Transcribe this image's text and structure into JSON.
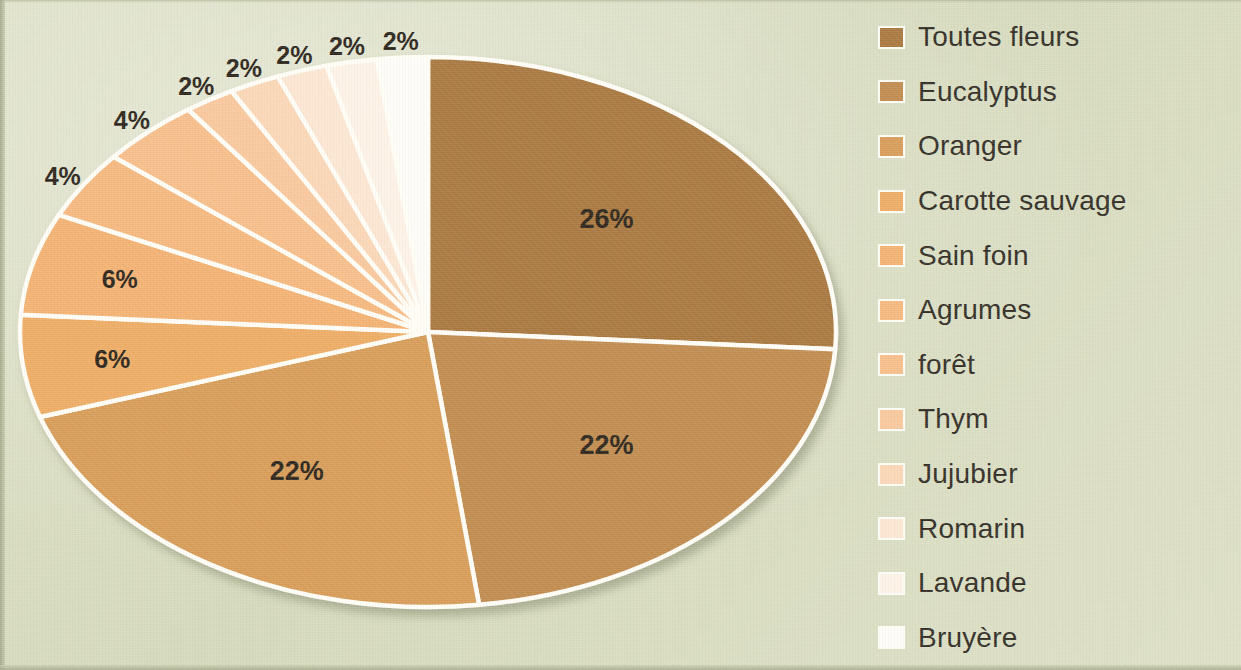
{
  "background_color": "#d9dcc1",
  "chart_data": {
    "type": "pie",
    "title": "",
    "legend_position": "right",
    "grid": false,
    "label_format": "percent",
    "categories": [
      "Toutes fleurs",
      "Eucalyptus",
      "Oranger",
      "Carotte sauvage",
      "Sain foin",
      "Agrumes",
      "forêt",
      "Thym",
      "Jujubier",
      "Romarin",
      "Lavande",
      "Bruyère"
    ],
    "values": [
      26,
      22,
      22,
      6,
      6,
      4,
      4,
      2,
      2,
      2,
      2,
      2
    ],
    "labels": [
      "26%",
      "22%",
      "22%",
      "6%",
      "6%",
      "4%",
      "4%",
      "2%",
      "2%",
      "2%",
      "2%",
      "2%"
    ],
    "colors": [
      "#a8763c",
      "#c08a4e",
      "#d79b57",
      "#edab63",
      "#f3b171",
      "#f5b77d",
      "#f7bd89",
      "#f8c79c",
      "#fad6b6",
      "#fce6d2",
      "#fdf2e6",
      "#fefcf8"
    ],
    "start_angle_deg": 0,
    "direction": "clockwise",
    "total": 100
  },
  "legend": {
    "items": [
      {
        "label": "Toutes fleurs",
        "color": "#a8763c"
      },
      {
        "label": "Eucalyptus",
        "color": "#c08a4e"
      },
      {
        "label": "Oranger",
        "color": "#d79b57"
      },
      {
        "label": "Carotte sauvage",
        "color": "#edab63"
      },
      {
        "label": "Sain foin",
        "color": "#f3b171"
      },
      {
        "label": "Agrumes",
        "color": "#f5b77d"
      },
      {
        "label": "forêt",
        "color": "#f7bd89"
      },
      {
        "label": "Thym",
        "color": "#f8c79c"
      },
      {
        "label": "Jujubier",
        "color": "#fad6b6"
      },
      {
        "label": "Romarin",
        "color": "#fce6d2"
      },
      {
        "label": "Lavande",
        "color": "#fdf2e6"
      },
      {
        "label": "Bruyère",
        "color": "#fefcf8"
      }
    ]
  }
}
